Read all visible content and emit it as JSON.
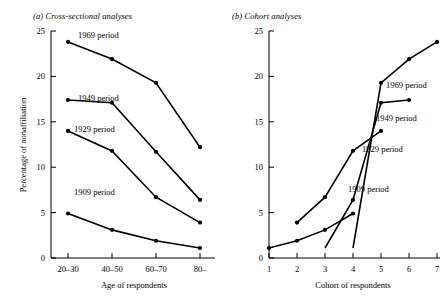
{
  "figure": {
    "background": "#ffffff",
    "ink_color": "#000000"
  },
  "panel_a": {
    "title": "(a) Cross-sectional analyses",
    "ylabel": "Percentage of nonaffiliation",
    "xlabel": "Age of respondents",
    "ytick_labels": [
      "0",
      "5",
      "10",
      "15",
      "20",
      "25"
    ],
    "xtick_labels": [
      "20–30",
      "40–50",
      "60–70",
      "80–"
    ],
    "series_labels": [
      "1969 period",
      "1949 period",
      "1929 period",
      "1909 period"
    ]
  },
  "panel_b": {
    "title": "(b) Cohort analyses",
    "xlabel": "Cohort of respondents",
    "ytick_labels": [
      "0",
      "5",
      "10",
      "15",
      "20",
      "25"
    ],
    "xtick_labels": [
      "1",
      "2",
      "3",
      "4",
      "5",
      "6",
      "7"
    ],
    "series_labels": [
      "1969 period",
      "1949 period",
      "1929 period",
      "1909 period"
    ]
  },
  "chart_data": [
    {
      "type": "line",
      "panel": "a",
      "title": "(a) Cross-sectional analyses",
      "xlabel": "Age of respondents",
      "ylabel": "Percentage of nonaffiliation",
      "categories": [
        "20–30",
        "40–50",
        "60–70",
        "80–"
      ],
      "ylim": [
        0,
        25
      ],
      "yticks": [
        0,
        5,
        10,
        15,
        20,
        25
      ],
      "grid": false,
      "legend": "inline-annotations",
      "series": [
        {
          "name": "1969 period",
          "values": [
            23.8,
            21.9,
            19.3,
            12.2
          ]
        },
        {
          "name": "1949 period",
          "values": [
            17.4,
            17.1,
            11.7,
            6.4
          ]
        },
        {
          "name": "1929 period",
          "values": [
            14.0,
            11.8,
            6.7,
            3.9
          ]
        },
        {
          "name": "1909 period",
          "values": [
            4.9,
            3.1,
            1.9,
            1.1
          ]
        }
      ]
    },
    {
      "type": "line",
      "panel": "b",
      "title": "(b) Cohort analyses",
      "xlabel": "Cohort of respondents",
      "ylabel": "Percentage of nonaffiliation",
      "x": [
        1,
        2,
        3,
        4,
        5,
        6,
        7
      ],
      "xlim": [
        1,
        7
      ],
      "ylim": [
        0,
        25
      ],
      "yticks": [
        0,
        5,
        10,
        15,
        20,
        25
      ],
      "grid": false,
      "legend": "inline-annotations",
      "series": [
        {
          "name": "1909 period",
          "x": [
            1,
            2,
            3,
            4
          ],
          "values": [
            1.1,
            1.9,
            3.1,
            4.9
          ]
        },
        {
          "name": "1929 period",
          "x": [
            2,
            3,
            4,
            5
          ],
          "values": [
            3.9,
            6.7,
            11.8,
            14.0
          ]
        },
        {
          "name": "1949 period",
          "x": [
            3,
            4,
            5,
            6
          ],
          "values": [
            1.1,
            6.4,
            17.1,
            17.4
          ]
        },
        {
          "name": "1969 period",
          "x": [
            4,
            5,
            6,
            7
          ],
          "values": [
            1.1,
            19.3,
            21.9,
            23.8
          ]
        }
      ]
    }
  ]
}
